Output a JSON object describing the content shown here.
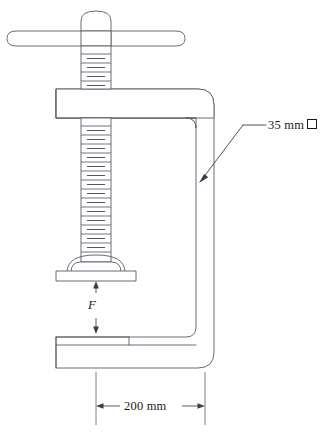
{
  "figure": {
    "background_color": "#ffffff",
    "line_color": "#5a5a66",
    "text_color": "#1a1a1a",
    "width": 335,
    "height": 434
  },
  "annotations": {
    "section_callout": {
      "name": "cross-section-callout",
      "value": "35 mm",
      "symbol": "square",
      "symbol_meaning": "square cross-section",
      "full_text": "35 mm □"
    },
    "span_dimension": {
      "name": "throat-span-dimension",
      "value": "200 mm",
      "arrow_style": "double-headed"
    },
    "force_label": {
      "name": "clamping-force-label",
      "value": "F",
      "style": "italic",
      "arrow_style": "opposing-pair"
    }
  },
  "parts": {
    "handle_bar": "T-handle bar",
    "screw": "threaded screw",
    "swivel_pad": "swivel pressure pad",
    "upper_jaw": "upper jaw",
    "lower_jaw": "lower jaw",
    "frame": "C-frame"
  }
}
